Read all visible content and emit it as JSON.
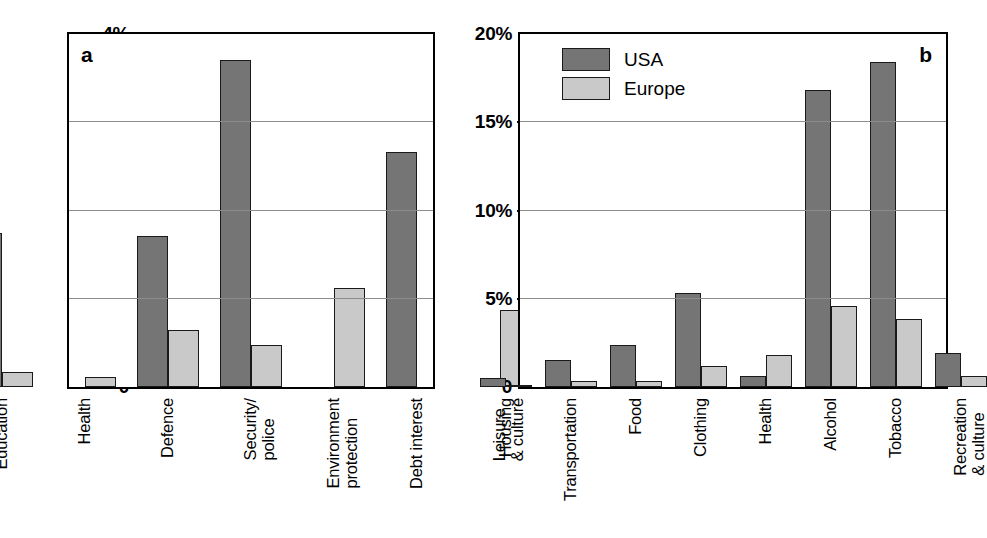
{
  "figure": {
    "panels": [
      "a",
      "b"
    ],
    "legend": {
      "position": "top-left of panel b",
      "entries": [
        {
          "label": "USA",
          "color": "#757575"
        },
        {
          "label": "Europe",
          "color": "#c9c9c9"
        }
      ]
    },
    "colors": {
      "usa": "#757575",
      "europe": "#c9c9c9",
      "axis": "#000000",
      "grid": "#8c8c8c",
      "background": "#ffffff"
    }
  },
  "chart_data": [
    {
      "type": "bar",
      "panel": "a",
      "title": "",
      "xlabel": "",
      "ylabel": "",
      "ylim": [
        0,
        4
      ],
      "yticks": [
        0,
        1,
        2,
        3,
        4
      ],
      "ytick_labels": [
        "0",
        "1%",
        "2%",
        "3%",
        "4%"
      ],
      "grid": true,
      "gridlines_at": [
        1,
        2,
        3
      ],
      "legend_position": "none",
      "categories": [
        "Education",
        "Health",
        "Defence",
        "Security/\npolice",
        "Environment\nprotection",
        "Debt interest",
        "Leisure\n& culture"
      ],
      "series": [
        {
          "name": "USA",
          "values": [
            1.75,
            0.0,
            1.71,
            3.7,
            0.0,
            2.66,
            0.0
          ]
        },
        {
          "name": "Europe",
          "values": [
            0.17,
            0.11,
            0.65,
            0.48,
            1.12,
            0.0,
            0.87
          ]
        }
      ]
    },
    {
      "type": "bar",
      "panel": "b",
      "title": "",
      "xlabel": "",
      "ylabel": "",
      "ylim": [
        0,
        20
      ],
      "yticks": [
        0,
        5,
        10,
        15,
        20
      ],
      "ytick_labels": [
        "0",
        "5%",
        "10%",
        "15%",
        "20%"
      ],
      "grid": true,
      "gridlines_at": [
        5,
        10,
        15
      ],
      "legend_position": "top-left",
      "categories": [
        "Housing",
        "Transportation",
        "Food",
        "Clothing",
        "Health",
        "Alcohol",
        "Tobacco",
        "Recreation\n& culture"
      ],
      "series": [
        {
          "name": "USA",
          "values": [
            0.5,
            1.55,
            2.4,
            5.35,
            0.65,
            16.8,
            18.4,
            1.95
          ]
        },
        {
          "name": "Europe",
          "values": [
            0.05,
            0.33,
            0.35,
            1.2,
            1.8,
            4.6,
            3.85,
            0.65
          ]
        }
      ]
    }
  ]
}
